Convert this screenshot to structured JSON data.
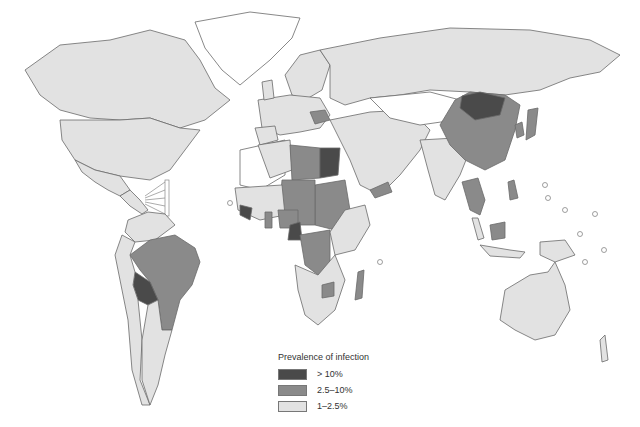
{
  "map": {
    "type": "choropleth world map",
    "subject": "Prevalence of infection"
  },
  "legend": {
    "title": "Prevalence of infection",
    "items": [
      {
        "label": "> 10%",
        "color": "#4a4a4a"
      },
      {
        "label": "2.5–10%",
        "color": "#8a8a8a"
      },
      {
        "label": "1–2.5%",
        "color": "#e2e2e2"
      }
    ]
  },
  "regions": {
    "high": [
      "Mongolia",
      "Egypt",
      "Bolivia",
      "Guinea",
      "Sierra Leone",
      "Cameroon"
    ],
    "medium": [
      "China",
      "Brazil",
      "Libya",
      "Niger",
      "Chad",
      "Sudan",
      "Nigeria",
      "DR Congo",
      "Central African Republic",
      "Romania",
      "Yemen",
      "Madagascar",
      "Thailand",
      "Cambodia",
      "Vietnam",
      "Philippines",
      "Japan",
      "Korea",
      "Ghana",
      "Gabon",
      "Zimbabwe",
      "French Guiana",
      "Malaysia (Borneo)"
    ],
    "low": [
      "North America",
      "Russia",
      "Australia",
      "India",
      "Argentina",
      "Europe",
      "Middle East",
      "Southern Africa"
    ]
  }
}
